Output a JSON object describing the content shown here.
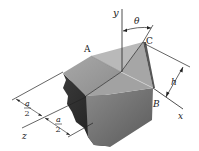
{
  "figure": {
    "labels": {
      "y_axis": "y",
      "x_axis": "x",
      "z_axis": "z",
      "point_a": "A",
      "point_b": "B",
      "point_c": "C",
      "angle": "θ",
      "height": "h",
      "half_a_num_1": "a",
      "half_a_den_1": "2",
      "half_a_num_2": "a",
      "half_a_den_2": "2"
    },
    "colors": {
      "top_face": "#9a9a9a",
      "triangle_face": "#b4b4b4",
      "front_face": "#6e6e6e",
      "dark_side": "#2e2e2e",
      "line": "#222222"
    }
  }
}
